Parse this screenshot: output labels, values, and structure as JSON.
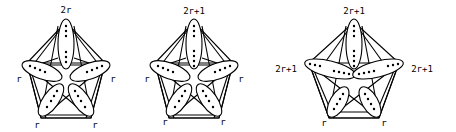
{
  "figure": {
    "diagrams": [
      {
        "id": "graph-1",
        "labels": {
          "top": "2r",
          "left": "r",
          "right": "r",
          "bottom_left": "r",
          "bottom_right": "r"
        }
      },
      {
        "id": "graph-2",
        "labels": {
          "top": "2r+1",
          "left": "r",
          "right": "r",
          "bottom_left": "r",
          "bottom_right": "r"
        }
      },
      {
        "id": "graph-3",
        "labels": {
          "top": "2r+1",
          "left": "2r+1",
          "right": "2r+1",
          "bottom_left": "r",
          "bottom_right": "r"
        }
      }
    ]
  }
}
